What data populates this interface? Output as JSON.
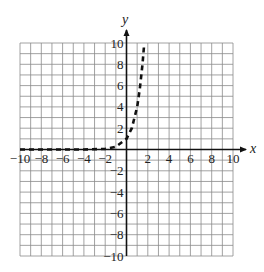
{
  "chart_data": {
    "type": "line",
    "title": "",
    "xlabel": "x",
    "ylabel": "y",
    "xlim": [
      -10,
      10
    ],
    "ylim": [
      -10,
      10
    ],
    "grid": true,
    "x_ticks": [
      "-10",
      "-8",
      "-6",
      "-4",
      "-2",
      "2",
      "4",
      "6",
      "8",
      "10"
    ],
    "y_ticks": [
      "10",
      "8",
      "6",
      "4",
      "2",
      "-2",
      "-4",
      "-6",
      "-8",
      "-10"
    ],
    "series": [
      {
        "name": "exponential curve (dashed)",
        "style": "dashed",
        "x": [
          -10,
          -8,
          -6,
          -4,
          -2,
          -1,
          0,
          0.5,
          1,
          1.25,
          1.5,
          1.65
        ],
        "y": [
          0,
          0,
          0,
          0,
          0.06,
          0.25,
          1,
          2,
          4,
          5.7,
          8,
          9.8
        ]
      }
    ]
  },
  "labels": {
    "x_axis": "x",
    "y_axis": "y",
    "xticks": [
      {
        "v": -10,
        "t": "−10"
      },
      {
        "v": -8,
        "t": "−8"
      },
      {
        "v": -6,
        "t": "−6"
      },
      {
        "v": -4,
        "t": "−4"
      },
      {
        "v": -2,
        "t": "−2"
      },
      {
        "v": 2,
        "t": "2"
      },
      {
        "v": 4,
        "t": "4"
      },
      {
        "v": 6,
        "t": "6"
      },
      {
        "v": 8,
        "t": "8"
      },
      {
        "v": 10,
        "t": "10"
      }
    ],
    "yticks": [
      {
        "v": 10,
        "t": "10"
      },
      {
        "v": 8,
        "t": "8"
      },
      {
        "v": 6,
        "t": "6"
      },
      {
        "v": 4,
        "t": "4"
      },
      {
        "v": 2,
        "t": "2"
      },
      {
        "v": -2,
        "t": "−2"
      },
      {
        "v": -4,
        "t": "−4"
      },
      {
        "v": -6,
        "t": "−6"
      },
      {
        "v": -8,
        "t": "−8"
      },
      {
        "v": -10,
        "t": "−10"
      }
    ]
  }
}
